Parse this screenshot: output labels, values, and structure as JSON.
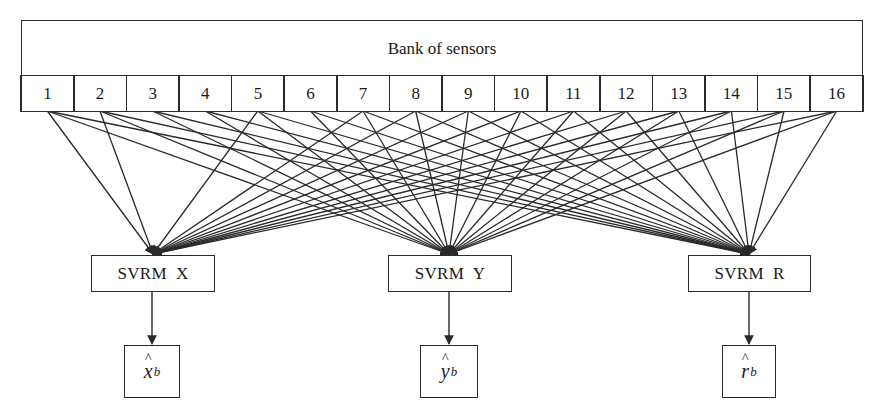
{
  "diagram": {
    "bank": {
      "title": "Bank of sensors",
      "sensors": [
        "1",
        "2",
        "3",
        "4",
        "5",
        "6",
        "7",
        "8",
        "9",
        "10",
        "11",
        "12",
        "13",
        "14",
        "15",
        "16"
      ]
    },
    "models": [
      {
        "id": "x",
        "label": "SVRM  X",
        "output_symbol": "x",
        "output_subscript": "b",
        "output_hat": "^"
      },
      {
        "id": "y",
        "label": "SVRM  Y",
        "output_symbol": "y",
        "output_subscript": "b",
        "output_hat": "^"
      },
      {
        "id": "r",
        "label": "SVRM  R",
        "output_symbol": "r",
        "output_subscript": "b",
        "output_hat": "^"
      }
    ],
    "connections": {
      "x": [
        1,
        2,
        5,
        7,
        8,
        9,
        10,
        11,
        12,
        13,
        14,
        15,
        16
      ],
      "y": [
        1,
        2,
        3,
        4,
        5,
        6,
        7,
        8,
        9,
        10,
        11,
        12,
        13,
        14,
        15,
        16
      ],
      "r": [
        1,
        2,
        3,
        4,
        5,
        6,
        7,
        8,
        9,
        10,
        11,
        12,
        13,
        14,
        15,
        16
      ]
    },
    "colors": {
      "line": "#2a2a2a",
      "background": "#ffffff"
    }
  }
}
